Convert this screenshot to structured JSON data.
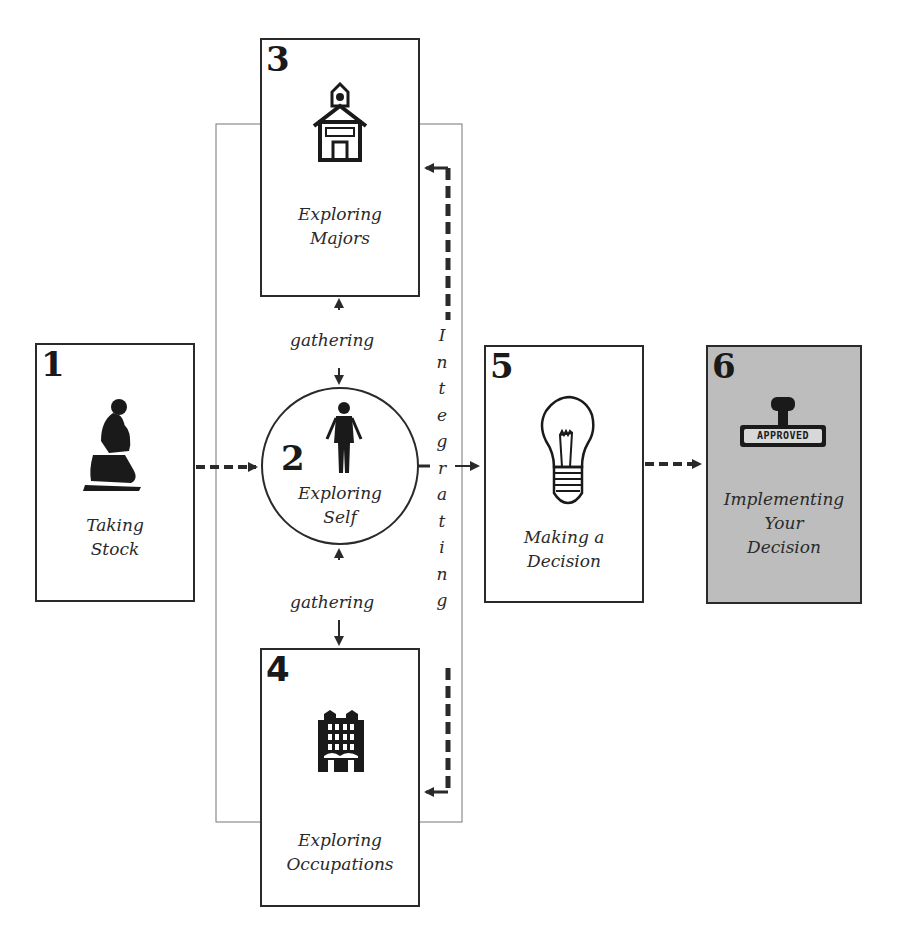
{
  "diagram": {
    "type": "process-flow",
    "steps": [
      {
        "number": "1",
        "label_lines": [
          "Taking",
          "Stock"
        ],
        "icon": "thinker-statue-icon"
      },
      {
        "number": "2",
        "label_lines": [
          "Exploring",
          "Self"
        ],
        "icon": "person-figure-icon"
      },
      {
        "number": "3",
        "label_lines": [
          "Exploring",
          "Majors"
        ],
        "icon": "schoolhouse-icon"
      },
      {
        "number": "4",
        "label_lines": [
          "Exploring",
          "Occupations"
        ],
        "icon": "office-building-icon"
      },
      {
        "number": "5",
        "label_lines": [
          "Making a",
          "Decision"
        ],
        "icon": "lightbulb-icon"
      },
      {
        "number": "6",
        "label_lines": [
          "Implementing",
          "Your",
          "Decision"
        ],
        "icon": "approved-stamp-icon",
        "stamp_text": "APPROVED"
      }
    ],
    "connectors": {
      "gathering_top": "gathering",
      "gathering_bottom": "gathering",
      "integrating_letters": [
        "I",
        "n",
        "t",
        "e",
        "g",
        "r",
        "a",
        "t",
        "i",
        "n",
        "g"
      ]
    },
    "colors": {
      "line": "#2a2a2a",
      "highlight_box": "#bdbdbd",
      "background": "#ffffff"
    }
  }
}
